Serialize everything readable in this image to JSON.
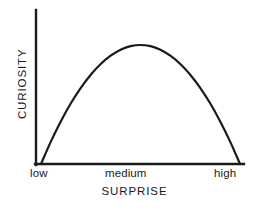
{
  "chart_data": {
    "type": "line",
    "title": "",
    "subtitle": "",
    "xlabel": "SURPRISE",
    "ylabel": "CURIOSITY",
    "xtick_labels": [
      "low",
      "medium",
      "high"
    ],
    "ytick_labels": [],
    "grid": false,
    "legend": null,
    "annotations": [],
    "axis_color": "#1a1a1a",
    "line_color": "#1a1a1a",
    "background_color": "#ffffff",
    "xlim": [
      0,
      1
    ],
    "ylim": [
      0,
      1
    ],
    "series": [
      {
        "name": "curiosity-vs-surprise",
        "shape": "inverted-u",
        "x": [
          0.0,
          0.05,
          0.1,
          0.15,
          0.2,
          0.25,
          0.3,
          0.35,
          0.4,
          0.45,
          0.5,
          0.55,
          0.6,
          0.65,
          0.7,
          0.75,
          0.8,
          0.85,
          0.9,
          0.95,
          1.0
        ],
        "y": [
          0.0,
          0.19,
          0.36,
          0.51,
          0.64,
          0.75,
          0.84,
          0.91,
          0.96,
          0.99,
          1.0,
          0.99,
          0.96,
          0.91,
          0.84,
          0.75,
          0.64,
          0.51,
          0.36,
          0.19,
          0.0
        ]
      }
    ]
  },
  "axes": {
    "xaxis_title": "SURPRISE",
    "yaxis_title": "CURIOSITY",
    "xticks": {
      "low": "low",
      "medium": "medium",
      "high": "high"
    }
  }
}
